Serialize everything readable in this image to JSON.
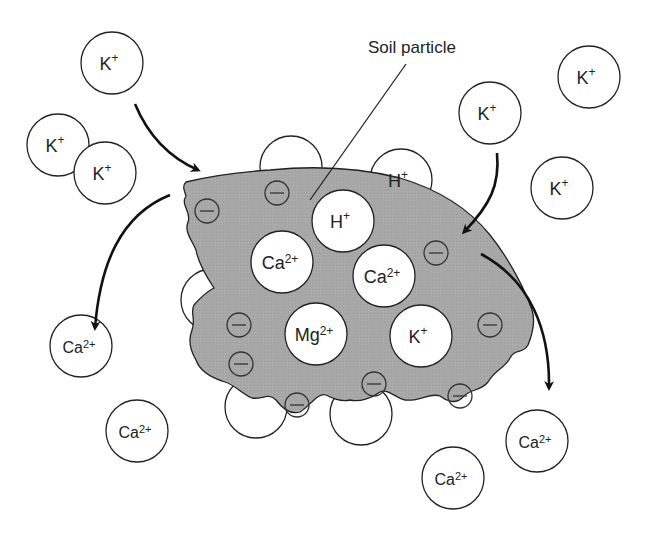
{
  "diagram": {
    "callout_label": "Soil particle",
    "colors": {
      "particle_fill": "#a9a9a9",
      "outline": "#222222",
      "ion_fill": "#ffffff"
    },
    "incoming_ions": [
      {
        "symbol": "K",
        "charge": "+",
        "x": 112,
        "y": 63
      },
      {
        "symbol": "K",
        "charge": "+",
        "x": 58,
        "y": 145
      },
      {
        "symbol": "K",
        "charge": "+",
        "x": 105,
        "y": 173
      },
      {
        "symbol": "K",
        "charge": "+",
        "x": 490,
        "y": 113
      },
      {
        "symbol": "K",
        "charge": "+",
        "x": 589,
        "y": 77
      },
      {
        "symbol": "K",
        "charge": "+",
        "x": 562,
        "y": 188
      }
    ],
    "displaced_ions": [
      {
        "symbol": "Ca",
        "charge": "2+",
        "x": 81,
        "y": 346
      },
      {
        "symbol": "Ca",
        "charge": "2+",
        "x": 137,
        "y": 431
      },
      {
        "symbol": "Ca",
        "charge": "2+",
        "x": 537,
        "y": 441
      },
      {
        "symbol": "Ca",
        "charge": "2+",
        "x": 453,
        "y": 478
      }
    ],
    "adsorbed_ions": [
      {
        "symbol": "H",
        "charge": "+",
        "x": 343,
        "y": 221
      },
      {
        "symbol": "Ca",
        "charge": "2+",
        "x": 282,
        "y": 262
      },
      {
        "symbol": "Ca",
        "charge": "2+",
        "x": 384,
        "y": 276
      },
      {
        "symbol": "Mg",
        "charge": "2+",
        "x": 316,
        "y": 334
      },
      {
        "symbol": "K",
        "charge": "+",
        "x": 421,
        "y": 336
      }
    ],
    "edge_ions": [
      {
        "symbol": "H",
        "charge": "+",
        "x": 401,
        "y": 180
      }
    ],
    "negative_charge_sites": 10,
    "arrows": [
      {
        "from": "K+ (top-left)",
        "to": "particle",
        "direction": "in"
      },
      {
        "from": "K+ (top-right)",
        "to": "particle",
        "direction": "in"
      },
      {
        "from": "particle",
        "to": "Ca2+ (left)",
        "direction": "out"
      },
      {
        "from": "particle",
        "to": "Ca2+ (right)",
        "direction": "out"
      }
    ]
  }
}
